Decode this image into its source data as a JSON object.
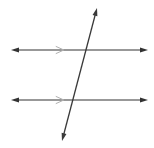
{
  "canvas": {
    "width": 154,
    "height": 148,
    "background_color": "#ffffff",
    "title": "Two parallel lines cut by a transversal"
  },
  "style": {
    "line_color": "#333333",
    "transversal_color": "#3a3a3a",
    "tick_mark_color": "#b0b0b0",
    "line_width": 1.1,
    "transversal_width": 1.3,
    "arrowhead_length": 8,
    "arrowhead_width": 5
  },
  "figure": {
    "kind": "geometry-diagram",
    "lines": [
      {
        "name": "upper-parallel-line",
        "role": "parallel",
        "x1": 11,
        "y1": 50,
        "x2": 148,
        "y2": 50,
        "arrow_start": true,
        "arrow_end": true,
        "tick": {
          "name": "chevron-tick",
          "glyph": ">",
          "x": 60,
          "y": 50,
          "size": 7,
          "color": "#b0b0b0"
        }
      },
      {
        "name": "lower-parallel-line",
        "role": "parallel",
        "x1": 11,
        "y1": 100,
        "x2": 148,
        "y2": 100,
        "arrow_start": true,
        "arrow_end": true,
        "tick": {
          "name": "chevron-tick",
          "glyph": ">",
          "x": 60,
          "y": 100,
          "size": 7,
          "color": "#b0b0b0"
        }
      },
      {
        "name": "transversal-line",
        "role": "transversal",
        "x1": 62,
        "y1": 141,
        "x2": 97,
        "y2": 8,
        "arrow_start": true,
        "arrow_end": true,
        "tick": null
      }
    ],
    "intersections": [
      {
        "name": "upper-intersection-point",
        "x": 83,
        "y": 50
      },
      {
        "name": "lower-intersection-point",
        "x": 71,
        "y": 100
      }
    ],
    "labels": []
  }
}
